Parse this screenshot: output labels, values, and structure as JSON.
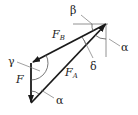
{
  "diagram": {
    "type": "force-triangle",
    "colors": {
      "stroke": "#1a1a1a",
      "thin": "#777777",
      "text": "#222222"
    },
    "vectors": [
      {
        "id": "F_B",
        "label": "F",
        "sub": "B"
      },
      {
        "id": "F_A",
        "label": "F",
        "sub": "A"
      },
      {
        "id": "F",
        "label": "F",
        "sub": ""
      }
    ],
    "angles": {
      "alpha_top": "α",
      "beta": "β",
      "delta": "δ",
      "gamma": "γ",
      "alpha_bottom": "α"
    }
  }
}
